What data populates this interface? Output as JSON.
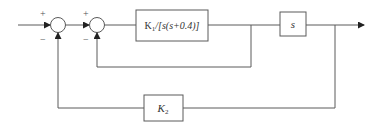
{
  "diagram": {
    "type": "block-diagram",
    "blocks": {
      "forward": {
        "label_prefix": "K",
        "label_sub": "1",
        "label_suffix": "/[s(s+0.4)]"
      },
      "derivative": {
        "label": "s"
      },
      "feedback_gain": {
        "label_main": "K",
        "label_sub": "2"
      }
    },
    "summing_junctions": [
      {
        "id": "sum1",
        "top_sign": "+",
        "bottom_sign": "−"
      },
      {
        "id": "sum2",
        "top_sign": "+",
        "bottom_sign": "−"
      }
    ],
    "colors": {
      "line": "#5a5a5a",
      "text": "#333333",
      "background": "#ffffff"
    }
  }
}
